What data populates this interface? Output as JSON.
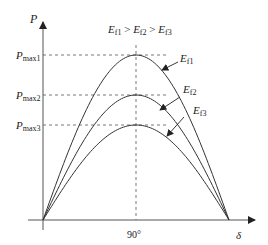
{
  "diagram": {
    "condition": {
      "E": "E",
      "s1": "f1",
      "gt1": " > ",
      "s2": "f2",
      "gt2": " > ",
      "s3": "f3"
    },
    "axes": {
      "y_label": "P",
      "x_label": "δ",
      "x_tick": "90°"
    },
    "levels": [
      {
        "label_main": "P",
        "label_sub": "max1",
        "y": 55
      },
      {
        "label_main": "P",
        "label_sub": "max2",
        "y": 95
      },
      {
        "label_main": "P",
        "label_sub": "max3",
        "y": 125
      }
    ],
    "curves": [
      {
        "name": "E",
        "sub": "f1",
        "peak_y": 55,
        "color": "#333333"
      },
      {
        "name": "E",
        "sub": "f2",
        "peak_y": 95,
        "color": "#333333"
      },
      {
        "name": "E",
        "sub": "f3",
        "peak_y": 125,
        "color": "#333333"
      }
    ],
    "curve_labels": [
      {
        "main": "E",
        "sub": "f1"
      },
      {
        "main": "E",
        "sub": "f2"
      },
      {
        "main": "E",
        "sub": "f3"
      }
    ]
  }
}
